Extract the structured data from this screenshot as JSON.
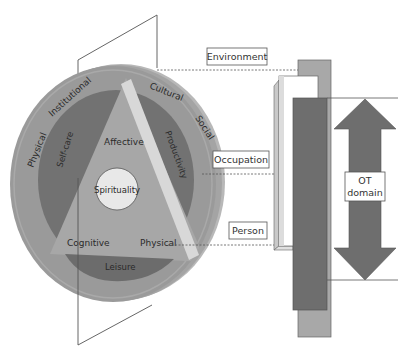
{
  "diagram": {
    "colors": {
      "disc_rim": "#b4b4b4",
      "disc_outer": "#999999",
      "ring_inner": "#6f6f6f",
      "triangle": "#a8a8a8",
      "band": "#d6d6d6",
      "spirituality_fill": "#e6e6e6",
      "leisure": "#707070",
      "bar_dark": "#6e6e6e",
      "bar_mid": "#a6a6a6",
      "bar_light": "#d2d2d2",
      "arrow": "#6e6e6e"
    },
    "environment_ring": {
      "labels": [
        "Physical",
        "Institutional",
        "Cultural",
        "Social"
      ]
    },
    "occupation_ring": {
      "labels": [
        "Self-care",
        "Productivity",
        "Leisure"
      ]
    },
    "person_triangle": {
      "labels": [
        "Affective",
        "Cognitive",
        "Physical"
      ],
      "center": "Spirituality"
    },
    "callouts": {
      "environment": "Environment",
      "occupation": "Occupation",
      "person": "Person"
    },
    "ot_domain": {
      "line1": "OT",
      "line2": "domain"
    }
  }
}
